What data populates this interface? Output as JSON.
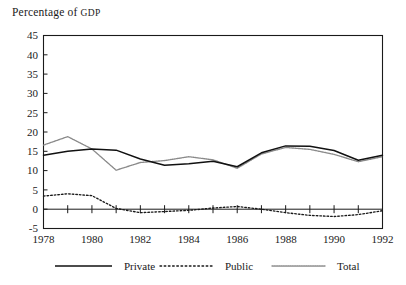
{
  "chart_data": {
    "type": "line",
    "title": "Percentage of GDP",
    "title_main": "Percentage of ",
    "title_smallcaps": "GDP",
    "xlabel": "",
    "ylabel": "Percentage of GDP",
    "grid": false,
    "legend_position": "bottom",
    "x": [
      1978,
      1979,
      1980,
      1981,
      1982,
      1983,
      1984,
      1985,
      1986,
      1987,
      1988,
      1989,
      1990,
      1991,
      1992
    ],
    "xlim": [
      1978,
      1992
    ],
    "ylim": [
      -5,
      45
    ],
    "xticks": [
      1978,
      1980,
      1982,
      1984,
      1986,
      1988,
      1990,
      1992
    ],
    "xtick_labels": [
      "1978",
      "1980",
      "1982",
      "1984",
      "1986",
      "1988",
      "1990",
      "1992"
    ],
    "yticks": [
      -5,
      0,
      5,
      10,
      15,
      20,
      25,
      30,
      35,
      40,
      45
    ],
    "ytick_labels": [
      "-5",
      "0",
      "5",
      "10",
      "15",
      "20",
      "25",
      "30",
      "35",
      "40",
      "45"
    ],
    "series": [
      {
        "name": "Private",
        "style": "solid",
        "color": "#111111",
        "values": [
          14.0,
          15.0,
          15.6,
          15.3,
          13.0,
          11.4,
          11.8,
          12.4,
          11.0,
          14.6,
          16.4,
          16.3,
          15.2,
          12.7,
          14.0
        ]
      },
      {
        "name": "Public",
        "style": "dotted",
        "color": "#1a1a1a",
        "values": [
          3.4,
          4.0,
          3.5,
          0.2,
          -0.9,
          -0.6,
          -0.3,
          0.3,
          0.7,
          0.0,
          -0.9,
          -1.6,
          -1.9,
          -1.4,
          -0.4
        ]
      },
      {
        "name": "Total",
        "style": "fine-dotted",
        "color": "#8a8a8a",
        "values": [
          16.6,
          18.8,
          15.6,
          10.1,
          12.1,
          12.6,
          13.6,
          12.8,
          10.6,
          14.3,
          16.0,
          15.5,
          14.2,
          12.3,
          13.6
        ]
      }
    ],
    "legend": [
      {
        "label": "Private",
        "style": "solid",
        "color": "#111111"
      },
      {
        "label": "Public",
        "style": "dotted",
        "color": "#1a1a1a"
      },
      {
        "label": "Total",
        "style": "fine-dotted",
        "color": "#8a8a8a"
      }
    ]
  }
}
